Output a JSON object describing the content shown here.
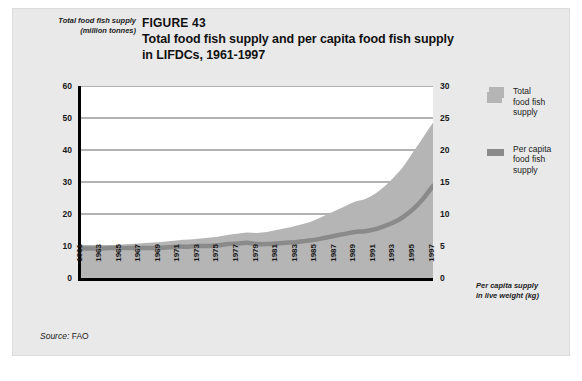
{
  "figure": {
    "number_label": "FIGURE 43",
    "title_line1": "Total food fish supply and per capita food fish supply",
    "title_line2": "in LIFDCs, 1961-1997",
    "source_key": "Source:",
    "source_value": " FAO"
  },
  "axes": {
    "left_caption_line1": "Total food fish supply",
    "left_caption_line2": "(million tonnes)",
    "right_caption_line1": "Per capita supply",
    "right_caption_line2": "in live weight (kg)",
    "left_ticks": [
      "60",
      "50",
      "40",
      "30",
      "20",
      "10",
      "0"
    ],
    "right_ticks": [
      "30",
      "25",
      "20",
      "15",
      "10",
      "5",
      "0"
    ],
    "x_ticks": [
      "1961",
      "1963",
      "1965",
      "1967",
      "1969",
      "1971",
      "1973",
      "1975",
      "1977",
      "1979",
      "1981",
      "1983",
      "1985",
      "1987",
      "1989",
      "1991",
      "1993",
      "1995",
      "1997"
    ]
  },
  "legend": {
    "items": [
      {
        "label_line1": "Total",
        "label_line2": "food fish",
        "label_line3": "supply",
        "swatch": "area-swatch",
        "color": "#b5b5b5"
      },
      {
        "label_line1": "Per capita",
        "label_line2": "food fish",
        "label_line3": "supply",
        "swatch": "line-swatch",
        "color": "#8a8a8a"
      }
    ]
  },
  "colors": {
    "panel_background": "#e9e9e9",
    "plot_background": "#ffffff",
    "area_fill": "#b5b5b5",
    "line_stroke": "#8a8a8a",
    "axis": "#000000",
    "gridline": "#555555"
  },
  "chart_data": {
    "type": "area",
    "title": "Total food fish supply and per capita food fish supply in LIFDCs, 1961-1997",
    "subtitle": "FIGURE 43",
    "xlabel": "",
    "ylabel": "Total food fish supply (million tonnes)",
    "y2label": "Per capita supply in live weight (kg)",
    "ylim": [
      0,
      60
    ],
    "y2lim": [
      0,
      30
    ],
    "yticks": [
      0,
      10,
      20,
      30,
      40,
      50,
      60
    ],
    "y2ticks": [
      0,
      5,
      10,
      15,
      20,
      25,
      30
    ],
    "grid": true,
    "legend_position": "right",
    "x": [
      1961,
      1962,
      1963,
      1964,
      1965,
      1966,
      1967,
      1968,
      1969,
      1970,
      1971,
      1972,
      1973,
      1974,
      1975,
      1976,
      1977,
      1978,
      1979,
      1980,
      1981,
      1982,
      1983,
      1984,
      1985,
      1986,
      1987,
      1988,
      1989,
      1990,
      1991,
      1992,
      1993,
      1994,
      1995,
      1996,
      1997
    ],
    "series": [
      {
        "name": "Total food fish supply",
        "unit": "million tonnes",
        "axis": "left",
        "type": "area",
        "color": "#b5b5b5",
        "values": [
          9.3,
          9.6,
          9.9,
          10.2,
          10.4,
          10.6,
          10.8,
          11.0,
          11.2,
          11.5,
          11.8,
          12.0,
          12.3,
          12.6,
          12.9,
          13.4,
          13.8,
          14.2,
          14.1,
          14.4,
          15.0,
          15.6,
          16.3,
          17.1,
          18.2,
          19.6,
          21.0,
          22.4,
          23.8,
          24.6,
          26.2,
          28.5,
          31.5,
          35.0,
          39.5,
          44.0,
          48.5
        ]
      },
      {
        "name": "Per capita food fish supply",
        "unit": "kg",
        "axis": "right",
        "type": "line",
        "color": "#8a8a8a",
        "values": [
          4.6,
          4.6,
          4.6,
          4.7,
          4.7,
          4.7,
          4.7,
          4.7,
          4.7,
          4.8,
          4.9,
          4.9,
          5.0,
          5.0,
          5.1,
          5.3,
          5.4,
          5.5,
          5.3,
          5.3,
          5.4,
          5.5,
          5.6,
          5.8,
          6.0,
          6.3,
          6.6,
          6.9,
          7.2,
          7.3,
          7.6,
          8.1,
          8.7,
          9.6,
          10.8,
          12.4,
          14.4
        ]
      }
    ]
  }
}
